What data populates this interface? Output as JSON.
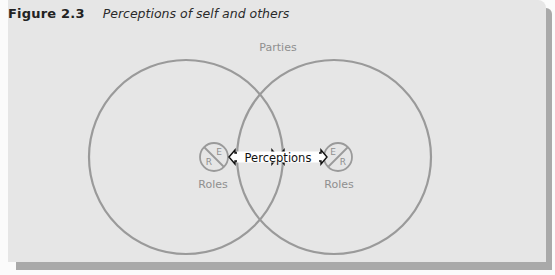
{
  "figure": {
    "number": "Figure 2.3",
    "title": "Perceptions of self and others"
  },
  "diagram": {
    "top_label": "Parties",
    "center_label": "Perceptions",
    "left_node": {
      "label": "Roles",
      "letters": [
        "E",
        "R"
      ]
    },
    "right_node": {
      "label": "Roles",
      "letters": [
        "E",
        "R"
      ]
    }
  },
  "colors": {
    "circle_stroke": "#9a9a9a",
    "panel_background": "#e6e6e6",
    "shadow": "#a9a9a9",
    "label_text": "#8f8f8f"
  }
}
